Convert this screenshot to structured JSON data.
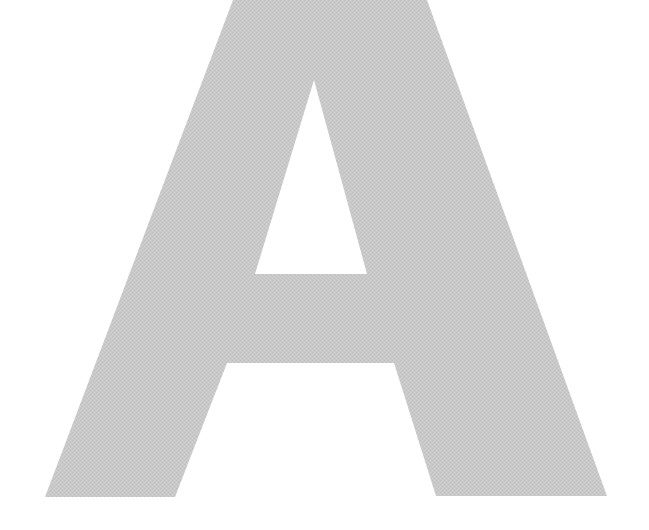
{
  "glyph": {
    "character": "A",
    "fill_color": "#c8c8c8",
    "background_color": "#ffffff",
    "texture": "halftone"
  }
}
